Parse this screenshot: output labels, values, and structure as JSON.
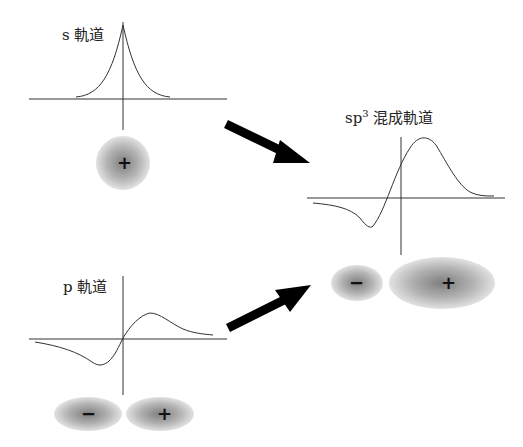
{
  "panels": {
    "s_orbital": {
      "label_prefix": "s",
      "label_suffix": "軌道",
      "lobes": [
        {
          "sign": "+"
        }
      ]
    },
    "p_orbital": {
      "label_prefix": "p",
      "label_suffix": "軌道",
      "lobes": [
        {
          "sign": "−"
        },
        {
          "sign": "+"
        }
      ]
    },
    "sp3_orbital": {
      "label_prefix": "sp",
      "label_sup": "3",
      "label_suffix": "混成軌道",
      "lobes": [
        {
          "sign": "−"
        },
        {
          "sign": "+"
        }
      ]
    }
  },
  "arrows": [
    {
      "from": "s_orbital",
      "to": "sp3_orbital"
    },
    {
      "from": "p_orbital",
      "to": "sp3_orbital"
    }
  ],
  "colors": {
    "line": "#333333",
    "arrow": "#000000",
    "lobe_center": "#8a8a8a",
    "lobe_edge": "#dcdcdc"
  }
}
